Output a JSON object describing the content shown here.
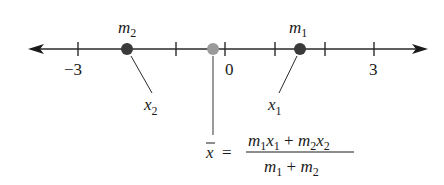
{
  "diagram": {
    "type": "number-line-center-of-mass",
    "tick_labels": [
      {
        "value": -3,
        "text": "−3",
        "x": 78
      },
      {
        "value": 0,
        "text": "0",
        "x": 225
      },
      {
        "value": 3,
        "text": "3",
        "x": 374
      }
    ],
    "ticks_x": [
      78,
      176,
      225,
      275,
      325,
      374
    ],
    "masses": [
      {
        "name": "m",
        "sub": "2",
        "pos_label": "x",
        "pos_sub": "2",
        "x": 127,
        "color": "#3a3a3a"
      },
      {
        "name": "m",
        "sub": "1",
        "pos_label": "x",
        "pos_sub": "1",
        "x": 300,
        "color": "#3a3a3a"
      }
    ],
    "center_of_mass": {
      "label": "x̄",
      "x": 213,
      "color": "#9a9a9a"
    },
    "formula": {
      "lhs": "x",
      "equals": "=",
      "numerator": [
        "m",
        "1",
        "x",
        "1",
        " + ",
        "m",
        "2",
        "x",
        "2"
      ],
      "denominator": [
        "m",
        "1",
        " + ",
        "m",
        "2"
      ]
    }
  }
}
